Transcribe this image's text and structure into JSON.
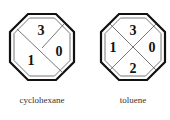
{
  "diagrams": [
    {
      "name": "cyclohexane",
      "caption": "cyclohexane",
      "layout": "diagonal",
      "values": {
        "top": "3",
        "right": "0",
        "left": "1"
      }
    },
    {
      "name": "toluene",
      "caption": "toluene",
      "layout": "cross",
      "values": {
        "top": "3",
        "right": "0",
        "left": "1",
        "bottom": "2"
      }
    }
  ],
  "colors": {
    "stroke": "#111111",
    "inner_stroke": "#555555"
  }
}
